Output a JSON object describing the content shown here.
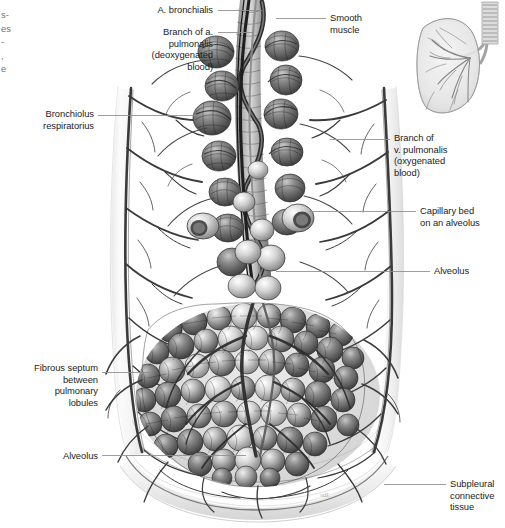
{
  "figure": {
    "background_color": "#ffffff",
    "width": 505,
    "height": 528,
    "ink_color": "#2b2b2b",
    "leader_line_color": "#8d8d8d",
    "signature": "vdL"
  },
  "labels": {
    "left": [
      {
        "name": "bronchiolus-respiratorius",
        "text": "Bronchiolus\nrespiratorius",
        "x": 22,
        "y": 108,
        "width": 72,
        "align": "right",
        "leader": {
          "x1": 98,
          "y1": 115,
          "x2": 200,
          "y2": 115
        }
      },
      {
        "name": "fibrous-septum",
        "text": "Fibrous septum\nbetween\npulmonary\nlobules",
        "x": 2,
        "y": 362,
        "width": 96,
        "align": "right",
        "leader": {
          "x1": 102,
          "y1": 372,
          "x2": 150,
          "y2": 372
        }
      },
      {
        "name": "alveolus-left",
        "text": "Alveolus",
        "x": 24,
        "y": 450,
        "width": 74,
        "align": "right",
        "leader": {
          "x1": 102,
          "y1": 455,
          "x2": 244,
          "y2": 455
        }
      }
    ],
    "top": [
      {
        "name": "a-bronchialis",
        "text": "A. bronchialis",
        "x": 140,
        "y": 4,
        "width": 73,
        "align": "right",
        "leader": {
          "x1": 218,
          "y1": 10,
          "x2": 258,
          "y2": 10
        }
      },
      {
        "name": "branch-a-pulmonalis",
        "text": "Branch of a.\npulmonalis\n(deoxygenated\nblood)",
        "x": 128,
        "y": 26,
        "width": 85,
        "align": "right",
        "leader": {
          "x1": 218,
          "y1": 32,
          "x2": 254,
          "y2": 32
        }
      }
    ],
    "right": [
      {
        "name": "smooth-muscle",
        "text": "Smooth\nmuscle",
        "x": 330,
        "y": 12,
        "width": 70,
        "align": "left",
        "leader": {
          "x1": 276,
          "y1": 18,
          "x2": 326,
          "y2": 18
        }
      },
      {
        "name": "branch-v-pulmonalis",
        "text": "Branch of\nv. pulmonalis\n(oxygenated\nblood)",
        "x": 394,
        "y": 132,
        "width": 92,
        "align": "left",
        "leader": {
          "x1": 330,
          "y1": 139,
          "x2": 390,
          "y2": 139
        }
      },
      {
        "name": "capillary-bed",
        "text": "Capillary bed\non an alveolus",
        "x": 420,
        "y": 205,
        "width": 84,
        "align": "left",
        "leader": {
          "x1": 313,
          "y1": 211,
          "x2": 416,
          "y2": 211
        }
      },
      {
        "name": "alveolus-right",
        "text": "Alveolus",
        "x": 434,
        "y": 265,
        "width": 66,
        "align": "left",
        "leader": {
          "x1": 276,
          "y1": 271,
          "x2": 430,
          "y2": 271
        }
      },
      {
        "name": "subpleural-connective-tissue",
        "text": "Subpleural\nconnective\ntissue",
        "x": 450,
        "y": 478,
        "width": 55,
        "align": "left",
        "leader": {
          "x1": 384,
          "y1": 484,
          "x2": 446,
          "y2": 484
        }
      }
    ],
    "edge_fragments": {
      "name": "cropped-column-fragment",
      "text": "s-\nes\n-\n,\ne",
      "x": 1,
      "y": 8
    }
  },
  "inset": {
    "name": "lung-orientation-inset",
    "description": "Translucent right lung with trachea and bronchial tree",
    "x": 404,
    "y": 2,
    "width": 98,
    "height": 118
  }
}
